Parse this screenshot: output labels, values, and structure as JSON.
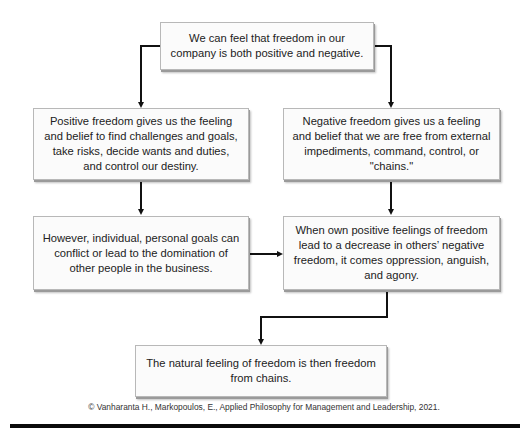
{
  "diagram": {
    "nodes": [
      {
        "id": "top",
        "text": "We can feel that freedom in our company is both positive and negative."
      },
      {
        "id": "positive",
        "text": "Positive freedom gives us the feeling and belief to find challenges and goals, take risks, decide wants and duties, and control our destiny."
      },
      {
        "id": "negative",
        "text": "Negative freedom gives us a feeling and belief that we are free from external impediments, command, control, or \"chains.\""
      },
      {
        "id": "conflict",
        "text": "However, individual, personal goals can conflict or lead to the domination of other people in the business."
      },
      {
        "id": "oppression",
        "text": "When own positive feelings of freedom lead to a decrease in others’ negative freedom, it comes oppression, anguish, and agony."
      },
      {
        "id": "natural",
        "text": "The natural feeling of freedom is then freedom from chains."
      }
    ],
    "edges": [
      {
        "from": "top",
        "to": "positive"
      },
      {
        "from": "top",
        "to": "negative"
      },
      {
        "from": "positive",
        "to": "conflict"
      },
      {
        "from": "negative",
        "to": "oppression"
      },
      {
        "from": "conflict",
        "to": "oppression"
      },
      {
        "from": "oppression",
        "to": "natural"
      }
    ]
  },
  "footer": {
    "citation": "© Vanharanta H., Markopoulos, E., Applied Philosophy for Management and Leadership, 2021."
  }
}
